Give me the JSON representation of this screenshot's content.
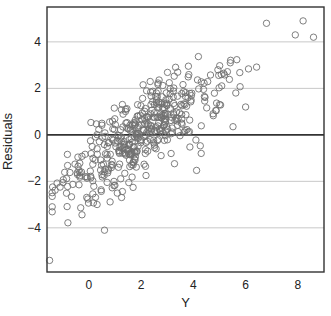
{
  "chart_data": {
    "type": "scatter",
    "title": "",
    "xlabel": "Y",
    "ylabel": "Residuals",
    "xlim": [
      -1.6,
      9.0
    ],
    "ylim": [
      -5.9,
      5.5
    ],
    "xticks": [
      0,
      2,
      4,
      6,
      8
    ],
    "yticks": [
      -4,
      -2,
      0,
      2,
      4
    ],
    "grid": "horizontal",
    "reference_line": {
      "y": 0,
      "color": "#333333"
    },
    "marker": {
      "shape": "open-circle",
      "color": "#707070",
      "radius": 3.2
    },
    "grid_color": "#c8c8c8",
    "frame_color": "#333333",
    "approx_point_count": 450,
    "trend": "residuals increase roughly linearly with Y (slope ~0.7), centered near (2, 0)",
    "notable_points": [
      {
        "x": -1.5,
        "y": -5.4
      },
      {
        "x": 0.6,
        "y": -4.1
      },
      {
        "x": 6.8,
        "y": 4.8
      },
      {
        "x": 8.2,
        "y": 4.9
      },
      {
        "x": 7.9,
        "y": 4.3
      },
      {
        "x": 8.6,
        "y": 4.2
      },
      {
        "x": 6.0,
        "y": 1.2
      },
      {
        "x": 4.3,
        "y": -0.8
      },
      {
        "x": 5.0,
        "y": 1.3
      }
    ],
    "seed": 7
  }
}
